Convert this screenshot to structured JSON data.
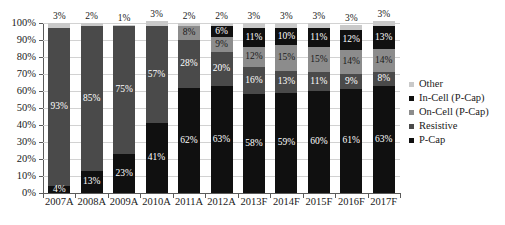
{
  "chart_data": {
    "type": "bar",
    "subtype": "stacked-percentage",
    "title": "",
    "xlabel": "",
    "ylabel": "",
    "ylim": [
      0,
      100
    ],
    "yticks": [
      "0%",
      "10%",
      "20%",
      "30%",
      "40%",
      "50%",
      "60%",
      "70%",
      "80%",
      "90%",
      "100%"
    ],
    "grid": true,
    "legend_position": "right",
    "categories": [
      "2007A",
      "2008A",
      "2009A",
      "2010A",
      "2011A",
      "2012A",
      "2013F",
      "2014F",
      "2015F",
      "2016F",
      "2017F"
    ],
    "series": [
      {
        "name": "P-Cap",
        "color": "#101010",
        "values": [
          4,
          13,
          23,
          41,
          62,
          63,
          58,
          59,
          60,
          61,
          63
        ],
        "labels": [
          "4%",
          "13%",
          "23%",
          "41%",
          "62%",
          "63%",
          "58%",
          "59%",
          "60%",
          "61%",
          "63%"
        ]
      },
      {
        "name": "Resistive",
        "color": "#4a4a4a",
        "values": [
          93,
          85,
          75,
          57,
          28,
          20,
          16,
          13,
          11,
          9,
          8
        ],
        "labels": [
          "93%",
          "85%",
          "75%",
          "57%",
          "28%",
          "20%",
          "16%",
          "13%",
          "11%",
          "9%",
          "8%"
        ]
      },
      {
        "name": "On-Cell (P-Cap)",
        "color": "#8c8c8c",
        "values": [
          0,
          0,
          0,
          0,
          8,
          9,
          12,
          15,
          15,
          14,
          14
        ],
        "labels": [
          "",
          "",
          "",
          "",
          "8%",
          "9%",
          "12%",
          "15%",
          "15%",
          "14%",
          "14%"
        ]
      },
      {
        "name": "In-Cell (P-Cap)",
        "color": "#101010",
        "values": [
          0,
          0,
          0,
          0,
          0,
          6,
          11,
          10,
          11,
          12,
          13
        ],
        "labels": [
          "",
          "",
          "",
          "",
          "",
          "6%",
          "11%",
          "10%",
          "11%",
          "12%",
          "13%"
        ]
      },
      {
        "name": "Other",
        "color": "#c9c9c9",
        "values": [
          3,
          2,
          1,
          3,
          2,
          2,
          3,
          3,
          3,
          3,
          3
        ],
        "labels": [
          "3%",
          "2%",
          "1%",
          "3%",
          "2%",
          "2%",
          "3%",
          "3%",
          "3%",
          "3%",
          "3%"
        ]
      }
    ],
    "legend": [
      {
        "label": "Other",
        "color": "#c9c9c9"
      },
      {
        "label": "In-Cell (P-Cap)",
        "color": "#101010"
      },
      {
        "label": "On-Cell (P-Cap)",
        "color": "#8c8c8c"
      },
      {
        "label": "Resistive",
        "color": "#4a4a4a"
      },
      {
        "label": "P-Cap",
        "color": "#101010"
      }
    ]
  }
}
